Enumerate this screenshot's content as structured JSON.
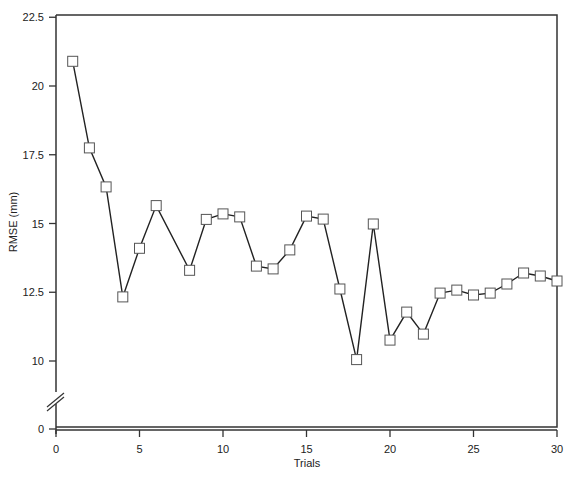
{
  "chart_data": {
    "type": "line",
    "title": "",
    "xlabel": "Trials",
    "ylabel": "RMSE (mm)",
    "xlim": [
      0,
      30
    ],
    "ylim": [
      0,
      22.5
    ],
    "y_axis_break": true,
    "y_axis_break_between": [
      0,
      10
    ],
    "grid": false,
    "legend": null,
    "marker": "open-square",
    "x_ticks": [
      0,
      5,
      10,
      15,
      20,
      25,
      30
    ],
    "x_tick_labels": [
      "0",
      "5",
      "10",
      "15",
      "20",
      "25",
      "30"
    ],
    "y_ticks": [
      0,
      10,
      12.5,
      15,
      17.5,
      20,
      22.5
    ],
    "y_tick_labels": [
      "0",
      "10",
      "12.5",
      "15",
      "17.5",
      "20",
      "22.5"
    ],
    "series": [
      {
        "name": "RMSE",
        "x": [
          1,
          2,
          3,
          4,
          5,
          6,
          8,
          9,
          10,
          11,
          12,
          13,
          14,
          15,
          16,
          17,
          18,
          19,
          20,
          21,
          22,
          23,
          24,
          25,
          26,
          27,
          28,
          29,
          30
        ],
        "values": [
          20.9,
          17.75,
          16.33,
          12.33,
          14.1,
          15.65,
          13.3,
          15.15,
          15.35,
          15.24,
          13.45,
          13.35,
          14.04,
          15.27,
          15.16,
          12.62,
          10.05,
          14.98,
          10.76,
          11.78,
          10.98,
          12.47,
          12.58,
          12.4,
          12.47,
          12.8,
          13.2,
          13.09,
          12.91
        ]
      }
    ]
  },
  "labels": {
    "xlabel": "Trials",
    "ylabel": "RMSE (mm)"
  }
}
